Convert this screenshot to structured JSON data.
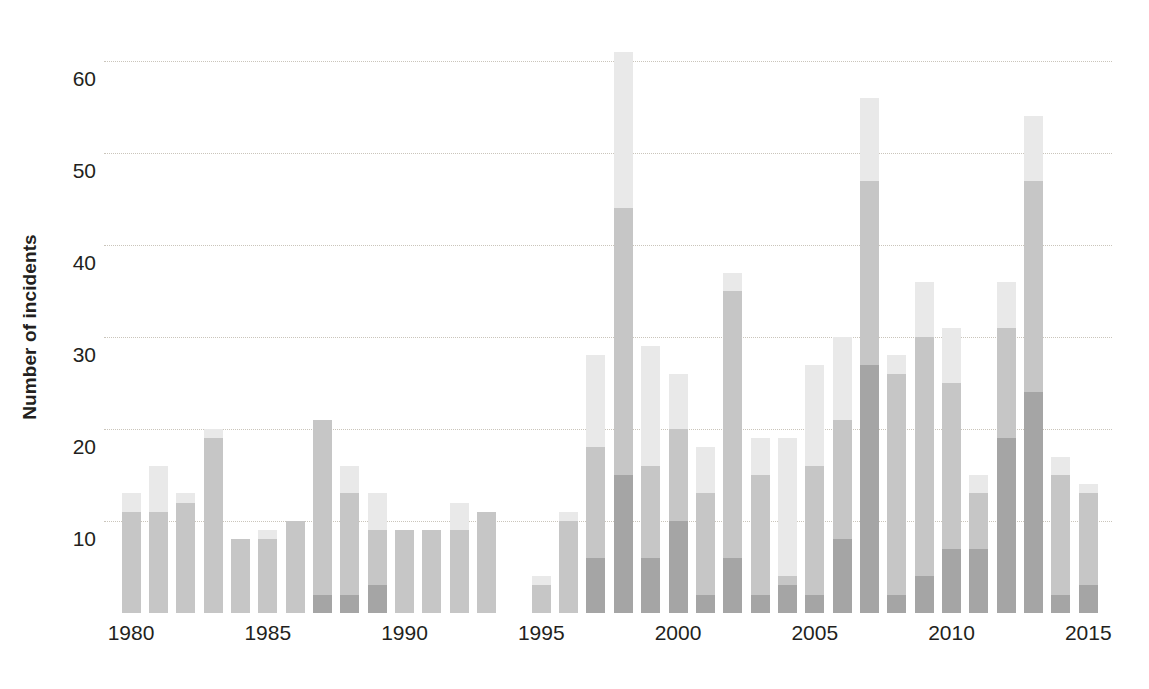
{
  "chart_data": {
    "type": "bar",
    "stacked": true,
    "title": "",
    "subtitle": "",
    "xlabel": "",
    "ylabel": "Number of incidents",
    "ylim": [
      0,
      64
    ],
    "xlim": [
      1979.5,
      2015.5
    ],
    "grid": true,
    "legend": null,
    "y_ticks": [
      10,
      20,
      30,
      40,
      50,
      60
    ],
    "y_tick_labels": [
      "10",
      "20",
      "30",
      "40",
      "50",
      "60"
    ],
    "x_ticks": [
      1980,
      1985,
      1990,
      1995,
      2000,
      2005,
      2010,
      2015
    ],
    "x_tick_labels": [
      "1980",
      "1985",
      "1990",
      "1995",
      "2000",
      "2005",
      "2010",
      "2015"
    ],
    "categories": [
      "1980",
      "1981",
      "1982",
      "1983",
      "1984",
      "1985",
      "1986",
      "1987",
      "1988",
      "1989",
      "1990",
      "1991",
      "1992",
      "1993",
      "1994",
      "1995",
      "1996",
      "1997",
      "1998",
      "1999",
      "2000",
      "2001",
      "2002",
      "2003",
      "2004",
      "2005",
      "2006",
      "2007",
      "2008",
      "2009",
      "2010",
      "2011",
      "2012",
      "2013",
      "2014",
      "2015"
    ],
    "series": [
      {
        "name": "bottom",
        "color": "#a5a5a5",
        "values": [
          0,
          0,
          0,
          0,
          0,
          0,
          0,
          2,
          2,
          3,
          0,
          0,
          0,
          0,
          0,
          0,
          0,
          6,
          15,
          6,
          10,
          2,
          6,
          2,
          3,
          2,
          8,
          27,
          2,
          4,
          7,
          7,
          19,
          24,
          2,
          3
        ]
      },
      {
        "name": "middle",
        "color": "#c6c6c6",
        "values": [
          11,
          11,
          12,
          19,
          8,
          8,
          10,
          19,
          11,
          6,
          9,
          9,
          9,
          11,
          0,
          3,
          10,
          12,
          29,
          10,
          10,
          11,
          29,
          13,
          1,
          14,
          13,
          20,
          24,
          26,
          18,
          6,
          12,
          23,
          13,
          10
        ]
      },
      {
        "name": "top",
        "color": "#e9e9e9",
        "values": [
          2,
          5,
          1,
          1,
          0,
          1,
          0,
          0,
          3,
          4,
          0,
          0,
          3,
          0,
          0,
          1,
          1,
          10,
          17,
          13,
          6,
          5,
          2,
          4,
          15,
          11,
          9,
          9,
          2,
          6,
          6,
          2,
          5,
          7,
          2,
          1
        ]
      }
    ],
    "totals": [
      13,
      16,
      13,
      20,
      8,
      9,
      10,
      21,
      16,
      13,
      9,
      9,
      12,
      11,
      0,
      4,
      11,
      28,
      61,
      29,
      26,
      18,
      37,
      19,
      19,
      27,
      30,
      56,
      28,
      36,
      31,
      15,
      36,
      54,
      17,
      14
    ]
  },
  "colors": {
    "segment_top": "#e9e9e9",
    "segment_middle": "#c6c6c6",
    "segment_bottom": "#a5a5a5",
    "gridline": "#c8c2b8",
    "text": "#231f20",
    "background": "#ffffff"
  }
}
